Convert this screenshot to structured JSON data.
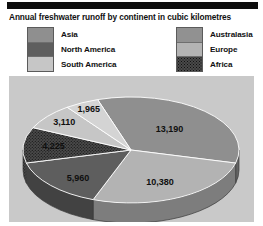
{
  "chart_title": "Annual freshwater runoff by continent in cubic kilometres",
  "legend": {
    "left_column": [
      {
        "label": "Asia",
        "color": "#8f8f8f"
      },
      {
        "label": "North America",
        "color": "#5e5e5e"
      },
      {
        "label": "South America",
        "color": "#c6c6c6"
      }
    ],
    "right_column": [
      {
        "label": "Australasia",
        "color": "#919191"
      },
      {
        "label": "Europe",
        "color": "#b3b3b3"
      },
      {
        "label": "Africa",
        "color": "#4a4a4a"
      }
    ]
  },
  "chart_data": {
    "type": "pie",
    "title": "Annual freshwater runoff by continent in cubic kilometres",
    "unit": "cubic kilometres",
    "categories": [
      "Asia",
      "Europe",
      "North America",
      "Africa",
      "South America",
      "Australasia"
    ],
    "values": [
      13190,
      10380,
      5960,
      4225,
      3110,
      1965
    ],
    "labels": [
      "13,190",
      "10,380",
      "5,960",
      "4,225",
      "3,110",
      "1,965"
    ],
    "series": [
      {
        "name": "Freshwater runoff",
        "points": [
          {
            "category": "Asia",
            "value": 13190,
            "label": "13,190",
            "color": "#8f8f8f"
          },
          {
            "category": "Europe",
            "value": 10380,
            "label": "10,380",
            "color": "#b3b3b3"
          },
          {
            "category": "North America",
            "value": 5960,
            "label": "5,960",
            "color": "#5e5e5e"
          },
          {
            "category": "Africa",
            "value": 4225,
            "label": "4,225",
            "color": "#4a4a4a"
          },
          {
            "category": "South America",
            "value": 3110,
            "label": "3,110",
            "color": "#c6c6c6"
          },
          {
            "category": "Australasia",
            "value": 1965,
            "label": "1,965",
            "color": "#d4d4d4"
          }
        ]
      }
    ],
    "legend": true,
    "legend_position": "top",
    "three_d": true,
    "grid": false,
    "xlabel": "",
    "ylabel": ""
  }
}
